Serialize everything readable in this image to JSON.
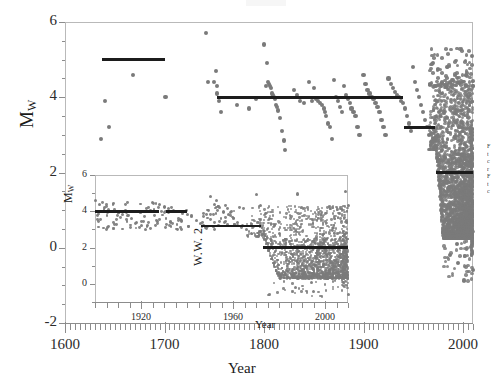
{
  "figure": {
    "main": {
      "ylabel": "M",
      "ylabel_sub": "W",
      "xlabel": "Year",
      "ytick_labels": [
        "6",
        "4",
        "2",
        "0",
        "-2"
      ],
      "xtick_labels": [
        "1600",
        "1700",
        "1800",
        "1900",
        "2000"
      ]
    },
    "inset": {
      "ylabel": "M",
      "ylabel_sub": "W",
      "xlabel": "Year",
      "ytick_labels": [
        "6",
        "4",
        "2",
        "0"
      ],
      "xtick_labels": [
        "1920",
        "1960",
        "2000"
      ],
      "annotation": "W.W. 2"
    },
    "side_caption_lines": [
      "F",
      "t",
      "c",
      "r",
      "F",
      "t",
      "c"
    ],
    "colors": {
      "dot": "#7a7a7a",
      "step_line": "#1c1c1c",
      "axis": "#8c8c8c",
      "frame": "#b9b9b9",
      "text": "#1a1a1a"
    }
  },
  "chart_data": {
    "type": "scatter",
    "title": "",
    "xlabel": "Year",
    "ylabel": "Mw",
    "xlim": [
      1600,
      2010
    ],
    "ylim": [
      -2,
      6
    ],
    "grid": false,
    "legend": null,
    "series": [
      {
        "name": "Earthquake magnitudes",
        "marker": "circle",
        "color": "#7a7a7a",
        "points": [
          [
            1636,
            2.9
          ],
          [
            1640,
            3.9
          ],
          [
            1644,
            3.2
          ],
          [
            1668,
            4.6
          ],
          [
            1701,
            4.0
          ],
          [
            1742,
            5.7
          ],
          [
            1744,
            4.4
          ],
          [
            1750,
            4.4
          ],
          [
            1752,
            4.7
          ],
          [
            1753,
            4.3
          ],
          [
            1753,
            4.1
          ],
          [
            1755,
            3.9
          ],
          [
            1757,
            3.6
          ],
          [
            1773,
            3.8
          ],
          [
            1785,
            3.7
          ],
          [
            1792,
            3.95
          ],
          [
            1800,
            5.4
          ],
          [
            1802,
            4.3
          ],
          [
            1803,
            4.9
          ],
          [
            1804,
            4.4
          ],
          [
            1805,
            4.35
          ],
          [
            1806,
            4.3
          ],
          [
            1807,
            4.25
          ],
          [
            1808,
            4.1
          ],
          [
            1809,
            4.05
          ],
          [
            1810,
            4.0
          ],
          [
            1811,
            3.95
          ],
          [
            1812,
            3.8
          ],
          [
            1813,
            3.75
          ],
          [
            1814,
            3.65
          ],
          [
            1816,
            3.45
          ],
          [
            1818,
            3.1
          ],
          [
            1820,
            2.85
          ],
          [
            1821,
            2.6
          ],
          [
            1830,
            4.2
          ],
          [
            1833,
            4.05
          ],
          [
            1836,
            3.9
          ],
          [
            1840,
            3.85
          ],
          [
            1845,
            4.4
          ],
          [
            1848,
            3.9
          ],
          [
            1850,
            4.25
          ],
          [
            1852,
            3.95
          ],
          [
            1854,
            3.9
          ],
          [
            1856,
            3.85
          ],
          [
            1858,
            3.8
          ],
          [
            1860,
            3.7
          ],
          [
            1861,
            3.6
          ],
          [
            1862,
            3.5
          ],
          [
            1864,
            3.3
          ],
          [
            1866,
            3.2
          ],
          [
            1868,
            2.9
          ],
          [
            1870,
            4.45
          ],
          [
            1872,
            4.0
          ],
          [
            1874,
            3.9
          ],
          [
            1876,
            3.75
          ],
          [
            1878,
            3.6
          ],
          [
            1880,
            4.3
          ],
          [
            1882,
            4.05
          ],
          [
            1884,
            3.95
          ],
          [
            1886,
            3.85
          ],
          [
            1888,
            3.7
          ],
          [
            1890,
            3.6
          ],
          [
            1892,
            3.5
          ],
          [
            1894,
            3.2
          ],
          [
            1896,
            3.0
          ],
          [
            1900,
            4.6
          ],
          [
            1902,
            4.35
          ],
          [
            1904,
            4.2
          ],
          [
            1906,
            4.1
          ],
          [
            1908,
            4.0
          ],
          [
            1910,
            3.95
          ],
          [
            1912,
            3.85
          ],
          [
            1914,
            3.75
          ],
          [
            1916,
            3.6
          ],
          [
            1918,
            3.4
          ],
          [
            1920,
            3.2
          ],
          [
            1922,
            3.0
          ],
          [
            1925,
            4.5
          ],
          [
            1928,
            4.35
          ],
          [
            1930,
            4.25
          ],
          [
            1932,
            4.15
          ],
          [
            1934,
            4.05
          ],
          [
            1936,
            4.0
          ],
          [
            1938,
            3.9
          ],
          [
            1940,
            3.85
          ],
          [
            1942,
            3.7
          ],
          [
            1944,
            3.5
          ],
          [
            1946,
            3.3
          ],
          [
            1948,
            3.1
          ],
          [
            1950,
            4.8
          ],
          [
            1952,
            4.4
          ],
          [
            1954,
            4.2
          ],
          [
            1956,
            4.0
          ],
          [
            1958,
            3.8
          ],
          [
            1960,
            3.6
          ],
          [
            1962,
            3.4
          ],
          [
            1964,
            3.2
          ],
          [
            1966,
            3.0
          ],
          [
            1968,
            2.8
          ],
          [
            1970,
            4.9
          ],
          [
            1972,
            4.3
          ],
          [
            1974,
            3.9
          ],
          [
            1976,
            3.6
          ],
          [
            1978,
            3.2
          ],
          [
            1980,
            2.8
          ],
          [
            1982,
            2.4
          ],
          [
            1984,
            2.0
          ],
          [
            1986,
            1.6
          ],
          [
            1988,
            1.2
          ],
          [
            1990,
            0.8
          ],
          [
            1992,
            0.4
          ],
          [
            1994,
            0.1
          ],
          [
            1996,
            2.5
          ],
          [
            1998,
            2.2
          ],
          [
            2000,
            1.9
          ],
          [
            2002,
            1.6
          ],
          [
            2004,
            1.3
          ],
          [
            2006,
            1.0
          ],
          [
            2008,
            0.6
          ],
          [
            2009,
            5.1
          ],
          [
            2010,
            4.3
          ],
          [
            2010,
            -0.6
          ],
          [
            1995,
            -0.4
          ],
          [
            1987,
            -0.2
          ]
        ],
        "note": "Dense cloud of several thousand events concentrated after 1965, spanning Mw -1 to 5; individual points sampled for rendering."
      }
    ],
    "step_function": {
      "name": "Magnitude of completeness (Mc)",
      "color": "#1c1c1c",
      "segments": [
        {
          "x_start": 1637,
          "x_end": 1700,
          "y": 5.0
        },
        {
          "x_start": 1753,
          "x_end": 1940,
          "y": 4.0
        },
        {
          "x_start": 1941,
          "x_end": 1972,
          "y": 3.2
        },
        {
          "x_start": 1973,
          "x_end": 2010,
          "y": 2.0
        }
      ]
    },
    "inset": {
      "type": "scatter",
      "xlabel": "Year",
      "ylabel": "Mw",
      "xlim": [
        1900,
        2010
      ],
      "ylim": [
        -1,
        6
      ],
      "annotation": "W.W. 2",
      "annotation_x": 1943,
      "step_function": {
        "segments": [
          {
            "x_start": 1900,
            "x_end": 1928,
            "y": 4.0
          },
          {
            "x_start": 1931,
            "x_end": 1940,
            "y": 4.0
          },
          {
            "x_start": 1946,
            "x_end": 1972,
            "y": 3.2
          },
          {
            "x_start": 1973,
            "x_end": 2010,
            "y": 2.0
          }
        ]
      }
    }
  }
}
